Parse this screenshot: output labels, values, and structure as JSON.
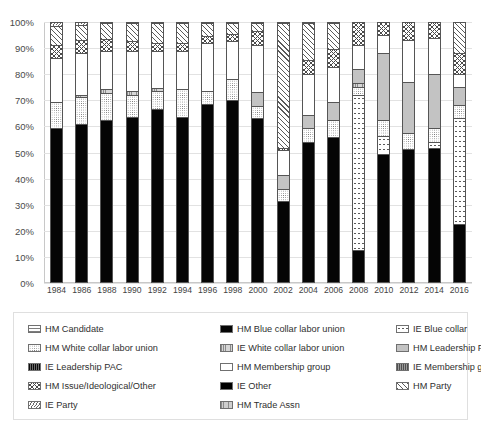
{
  "chart_data": {
    "type": "bar",
    "subtype": "stacked-100-percent",
    "title": "",
    "xlabel": "",
    "ylabel": "",
    "ylim": [
      0,
      100
    ],
    "ytick_labels": [
      "0%",
      "10%",
      "20%",
      "30%",
      "40%",
      "50%",
      "60%",
      "70%",
      "80%",
      "90%",
      "100%"
    ],
    "ytick_values": [
      0,
      10,
      20,
      30,
      40,
      50,
      60,
      70,
      80,
      90,
      100
    ],
    "grid": true,
    "legend_position": "bottom",
    "categories": [
      "1984",
      "1986",
      "1988",
      "1990",
      "1992",
      "1994",
      "1996",
      "1998",
      "2000",
      "2002",
      "2004",
      "2006",
      "2008",
      "2010",
      "2012",
      "2014",
      "2016"
    ],
    "series": [
      {
        "name": "HM Blue collar labor union",
        "pattern": "solid-black",
        "values": [
          59.0,
          60.5,
          62.0,
          63.5,
          66.5,
          63.5,
          68.5,
          70.0,
          63.0,
          31.0,
          53.5,
          55.5,
          12.0,
          49.0,
          51.0,
          51.5,
          22.0
        ]
      },
      {
        "name": "IE Blue collar",
        "pattern": "sparse-dots",
        "values": [
          0,
          0,
          0,
          0,
          0,
          0,
          0,
          0,
          0,
          0,
          0,
          0,
          60.0,
          7.0,
          0,
          2.0,
          41.0
        ]
      },
      {
        "name": "HM White collar labor union",
        "pattern": "fine-dots",
        "values": [
          10.0,
          10.5,
          10.5,
          8.5,
          7.0,
          10.5,
          5.0,
          8.0,
          4.5,
          4.5,
          5.5,
          6.5,
          3.0,
          6.0,
          6.0,
          5.5,
          5.0
        ]
      },
      {
        "name": "IE White collar labor union",
        "pattern": "vert-hatch-gray",
        "values": [
          0,
          1.0,
          1.5,
          1.5,
          1.0,
          0,
          0,
          0,
          0,
          0,
          0,
          0,
          1.5,
          0,
          0,
          0,
          0
        ]
      },
      {
        "name": "HM Leadership PAC",
        "pattern": "solid-gray",
        "values": [
          0,
          0,
          0,
          0,
          0,
          0,
          0,
          0,
          5.5,
          5.5,
          5.0,
          7.0,
          5.5,
          26.0,
          20.0,
          21.0,
          7.0
        ]
      },
      {
        "name": "HM Membership group",
        "pattern": "white",
        "values": [
          17.0,
          16.0,
          15.0,
          15.5,
          14.5,
          15.0,
          18.5,
          14.5,
          18.0,
          9.5,
          16.0,
          13.5,
          9.0,
          7.0,
          16.0,
          14.0,
          5.0
        ]
      },
      {
        "name": "HM Issue/Ideological/Other",
        "pattern": "cross-hatch",
        "values": [
          5.0,
          5.0,
          4.5,
          3.5,
          3.0,
          3.0,
          2.5,
          3.0,
          5.5,
          1.0,
          5.5,
          7.0,
          9.0,
          5.0,
          7.0,
          6.0,
          8.0
        ]
      },
      {
        "name": "HM Trade Assn",
        "pattern": "vert-hatch-light",
        "values": [
          0,
          0,
          0,
          0,
          0,
          0,
          0,
          0,
          0,
          0,
          0,
          0,
          0,
          0,
          0,
          0,
          0
        ]
      },
      {
        "name": "IE Other",
        "pattern": "solid-black2",
        "values": [
          0,
          0,
          0,
          0,
          0,
          0,
          0,
          0,
          0,
          0,
          0,
          0,
          0,
          0,
          0,
          0,
          0
        ]
      },
      {
        "name": "HM Party",
        "pattern": "diag-hatch",
        "values": [
          7.5,
          6.0,
          6.0,
          7.0,
          7.5,
          7.5,
          5.0,
          4.0,
          3.0,
          48.0,
          14.0,
          10.0,
          0,
          0,
          0,
          0,
          12.0
        ]
      },
      {
        "name": "IE Party",
        "pattern": "fine-diag",
        "values": [
          1.5,
          1.0,
          0.5,
          0.5,
          0.5,
          0.5,
          0.5,
          0.5,
          0.5,
          0.5,
          0.5,
          0.5,
          0,
          0,
          0,
          0,
          0
        ]
      }
    ]
  },
  "yaxis": {
    "ticks": [
      "100%",
      "90%",
      "80%",
      "70%",
      "60%",
      "50%",
      "40%",
      "30%",
      "20%",
      "10%",
      "0%"
    ]
  },
  "xaxis": {
    "ticks": [
      "1984",
      "1986",
      "1988",
      "1990",
      "1992",
      "1994",
      "1996",
      "1998",
      "2000",
      "2002",
      "2004",
      "2006",
      "2008",
      "2010",
      "2012",
      "2014",
      "2016"
    ]
  },
  "legend": {
    "items": [
      {
        "label": "HM Candidate",
        "swatch": "hm-candidate"
      },
      {
        "label": "HM Blue collar labor union",
        "swatch": "hm-blue"
      },
      {
        "label": "IE Blue collar",
        "swatch": "ie-blue"
      },
      {
        "label": "HM White collar labor union",
        "swatch": "hm-white"
      },
      {
        "label": "IE White collar labor union",
        "swatch": "ie-white"
      },
      {
        "label": "HM Leadership PAC",
        "swatch": "hm-leadership"
      },
      {
        "label": "IE Leadership PAC",
        "swatch": "ie-leadership"
      },
      {
        "label": "HM Membership group",
        "swatch": "hm-membership"
      },
      {
        "label": "IE Membership group",
        "swatch": "ie-membership"
      },
      {
        "label": "HM Issue/Ideological/Other",
        "swatch": "hm-issue"
      },
      {
        "label": "IE Other",
        "swatch": "ie-other"
      },
      {
        "label": "HM Party",
        "swatch": "hm-party"
      },
      {
        "label": "IE Party",
        "swatch": "ie-party"
      },
      {
        "label": "HM Trade Assn",
        "swatch": "hm-trade"
      }
    ]
  }
}
